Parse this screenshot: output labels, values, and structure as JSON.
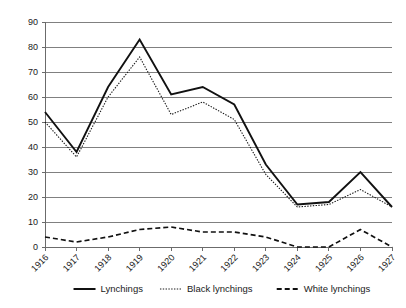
{
  "chart_data": {
    "type": "line",
    "title": "",
    "xlabel": "",
    "ylabel": "",
    "categories": [
      "1916",
      "1917",
      "1918",
      "1919",
      "1920",
      "1921",
      "1922",
      "1923",
      "1924",
      "1925",
      "1926",
      "1927"
    ],
    "series": [
      {
        "name": "Lynchings",
        "style": "solid",
        "values": [
          54,
          38,
          64,
          83,
          61,
          64,
          57,
          33,
          17,
          18,
          30,
          16
        ]
      },
      {
        "name": "Black lynchings",
        "style": "dotted",
        "values": [
          50,
          36,
          60,
          76,
          53,
          58,
          51,
          29,
          16,
          17,
          23,
          16
        ]
      },
      {
        "name": "White lynchings",
        "style": "dashed",
        "values": [
          4,
          2,
          4,
          7,
          8,
          6,
          6,
          4,
          0,
          0,
          7,
          0
        ]
      }
    ],
    "ylim": [
      0,
      90
    ],
    "ytick_labels": [
      "0",
      "10",
      "20",
      "30",
      "40",
      "50",
      "60",
      "70",
      "80",
      "90"
    ],
    "ytick_values": [
      0,
      10,
      20,
      30,
      40,
      50,
      60,
      70,
      80,
      90
    ],
    "grid": true,
    "grid_axis": "y",
    "legend_position": "bottom",
    "xtick_rotation": -45,
    "colors": {
      "total": "#111111",
      "black": "#1a1a1a",
      "white": "#111111",
      "grid": "#808080",
      "axis": "#6b6b6b",
      "background": "#ffffff",
      "text": "#1a1a1a"
    }
  },
  "legend": {
    "items": [
      {
        "label": "Lynchings"
      },
      {
        "label": "Black lynchings"
      },
      {
        "label": "White lynchings"
      }
    ]
  }
}
